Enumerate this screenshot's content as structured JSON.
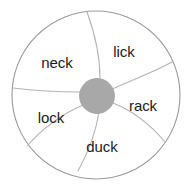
{
  "figure": {
    "name": "word-wheel-diagram",
    "shape": "circle",
    "segment_count": 6,
    "background_color": "#ffffff",
    "outline_color": "#9a9a9a",
    "spoke_color": "#b0b0b0",
    "hub_color": "#a8a8a8",
    "text_color": "#1b1b1b"
  },
  "wheel": {
    "center": {
      "x": 96,
      "y": 95
    },
    "radius": 84,
    "hub_radius": 17,
    "segments": [
      {
        "id": "segment-lick",
        "label": "lick",
        "label_x": 124,
        "label_y": 51
      },
      {
        "id": "segment-rack",
        "label": "rack",
        "label_x": 143,
        "label_y": 105
      },
      {
        "id": "segment-duck",
        "label": "duck",
        "label_x": 102,
        "label_y": 146
      },
      {
        "id": "segment-lock",
        "label": "lock",
        "label_x": 51,
        "label_y": 117
      },
      {
        "id": "segment-neck",
        "label": "neck",
        "label_x": 57,
        "label_y": 62
      },
      {
        "id": "segment-blank",
        "label": "",
        "label_x": 0,
        "label_y": 0
      }
    ]
  }
}
